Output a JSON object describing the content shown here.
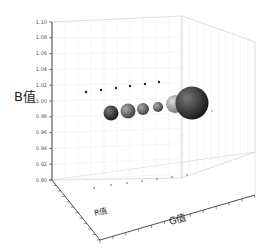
{
  "chart_data": {
    "type": "scatter3d-bubble",
    "title": "",
    "zlabel": "B值",
    "xlabel": "G值",
    "ylabel": "R值",
    "zlim": [
      0.9,
      1.1
    ],
    "z_ticks": [
      "0.90",
      "0.92",
      "0.94",
      "0.96",
      "0.98",
      "1.00",
      "1.02",
      "1.04",
      "1.06",
      "1.08",
      "1.10"
    ],
    "grid": true,
    "series": [
      {
        "name": "bubbles",
        "points": [
          {
            "i": 1,
            "z": 0.98,
            "size": 8,
            "color": "#3a3a3a"
          },
          {
            "i": 2,
            "z": 0.98,
            "size": 8,
            "color": "#6a6a6a"
          },
          {
            "i": 3,
            "z": 0.98,
            "size": 7,
            "color": "#7a7a7a"
          },
          {
            "i": 4,
            "z": 0.98,
            "size": 6,
            "color": "#8a8a8a"
          },
          {
            "i": 5,
            "z": 0.98,
            "size": 10,
            "color": "#aaaaaa"
          },
          {
            "i": 6,
            "z": 0.98,
            "size": 17,
            "color": "#2a2a2a"
          }
        ]
      },
      {
        "name": "projection-dots",
        "points": [
          {
            "i": 1,
            "z": 1.0
          },
          {
            "i": 2,
            "z": 1.0
          },
          {
            "i": 3,
            "z": 1.0
          },
          {
            "i": 4,
            "z": 1.0
          },
          {
            "i": 5,
            "z": 1.0
          },
          {
            "i": 6,
            "z": 1.0
          }
        ]
      }
    ]
  },
  "labels": {
    "z_axis": "B值",
    "x_axis": "G值",
    "y_axis": "R值"
  }
}
